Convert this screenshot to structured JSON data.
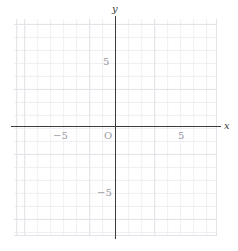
{
  "chart_data": {
    "type": "scatter",
    "title": "",
    "xlabel": "x",
    "ylabel": "y",
    "xlim": [
      -8,
      8
    ],
    "ylim": [
      -8.5,
      8.5
    ],
    "grid": true,
    "grid_minor_step": 1,
    "grid_major_step": 5,
    "legend": null,
    "series": [],
    "x_ticks": [
      -5,
      5
    ],
    "y_ticks": [
      -5,
      5
    ],
    "x_tick_labels": [
      "−5",
      "5"
    ],
    "y_tick_labels": [
      "−5",
      "5"
    ],
    "origin_label": "O"
  },
  "axes": {
    "x_name": "x",
    "y_name": "y",
    "origin": "O",
    "x_tick_neg5": "−5",
    "x_tick_pos5": "5",
    "y_tick_neg5": "−5",
    "y_tick_pos5": "5"
  },
  "colors": {
    "axis": "#3b3b3b",
    "grid_minor": "#efeff3",
    "grid_major": "#e2e2e8",
    "tick_label": "#9a9a9f",
    "background": "#ffffff"
  }
}
